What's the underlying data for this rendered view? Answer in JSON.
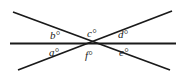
{
  "figure": {
    "name": "intersecting-lines-angle-diagram",
    "width": 184,
    "height": 78,
    "background_color": "#ffffff",
    "line_color": "#1a1a1a",
    "text_color": "#1a1a1a",
    "intersection_point": {
      "x": 92,
      "y": 43
    },
    "lines": [
      {
        "id": "horizontal-line",
        "label": "horizontal line",
        "x1": 10,
        "y1": 43.5,
        "x2": 176,
        "y2": 43.5,
        "stroke_width": 1.8
      },
      {
        "id": "descending-diagonal-line",
        "label": "diagonal line from upper-left to lower-right",
        "x1": 13,
        "y1": 12,
        "x2": 170,
        "y2": 70,
        "stroke_width": 1.8
      },
      {
        "id": "ascending-diagonal-line",
        "label": "diagonal line from lower-left to upper-right",
        "x1": 18,
        "y1": 70,
        "x2": 172,
        "y2": 11,
        "stroke_width": 1.8
      }
    ],
    "labels": [
      {
        "id": "angle-b",
        "text": "b°",
        "x": 50,
        "y": 30
      },
      {
        "id": "angle-c",
        "text": "c°",
        "x": 87,
        "y": 28
      },
      {
        "id": "angle-d",
        "text": "d°",
        "x": 118,
        "y": 29
      },
      {
        "id": "angle-a",
        "text": "a°",
        "x": 49,
        "y": 47
      },
      {
        "id": "angle-f",
        "text": "f°",
        "x": 85,
        "y": 50
      },
      {
        "id": "angle-e",
        "text": "e°",
        "x": 119,
        "y": 47
      }
    ]
  }
}
